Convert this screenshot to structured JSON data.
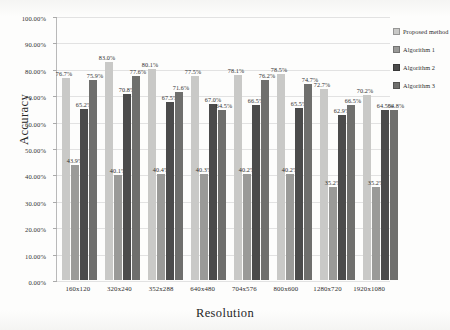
{
  "chart_data": {
    "type": "bar",
    "title": "",
    "xlabel": "Resolution",
    "ylabel": "Accuracy",
    "ylim": [
      0,
      100
    ],
    "ytick_labels": [
      "0.00%",
      "10.00%",
      "20.00%",
      "30.00%",
      "40.00%",
      "50.00%",
      "60.00%",
      "70.00%",
      "80.00%",
      "90.00%",
      "100.00%"
    ],
    "ytick_values": [
      0,
      10,
      20,
      30,
      40,
      50,
      60,
      70,
      80,
      90,
      100
    ],
    "grid": true,
    "legend_position": "right",
    "categories": [
      "160x120",
      "320x240",
      "352x288",
      "640x480",
      "704x576",
      "800x600",
      "1280x720",
      "1920x1080"
    ],
    "series": [
      {
        "name": "Proposed method",
        "color": "#c9c9c7",
        "values": [
          76.7,
          83.0,
          80.1,
          77.5,
          78.1,
          78.5,
          72.7,
          70.2
        ],
        "labels": [
          "76.7%",
          "83.0%",
          "80.1%",
          "77.5%",
          "78.1%",
          "78.5%",
          "72.7%",
          "70.2%"
        ]
      },
      {
        "name": "Algorithm 1",
        "color": "#9a9a98",
        "values": [
          43.9,
          40.1,
          40.4,
          40.3,
          40.2,
          40.2,
          35.2,
          35.2
        ],
        "labels": [
          "43.9%",
          "40.1%",
          "40.4%",
          "40.3%",
          "40.2%",
          "40.2%",
          "35.2%",
          "35.2%"
        ]
      },
      {
        "name": "Algorithm 2",
        "color": "#4b4b4b",
        "values": [
          65.2,
          70.8,
          67.5,
          67.0,
          66.5,
          65.5,
          62.9,
          64.5
        ],
        "labels": [
          "65.2%",
          "70.8%",
          "67.5%",
          "67.0%",
          "66.5%",
          "65.5%",
          "62.9%",
          "64.5%"
        ]
      },
      {
        "name": "Algorithm 3",
        "color": "#6f6f6d",
        "values": [
          75.9,
          77.6,
          71.6,
          64.5,
          76.2,
          74.7,
          66.5,
          64.8
        ],
        "labels": [
          "75.9%",
          "77.6%",
          "71.6%",
          "64.5%",
          "76.2%",
          "74.7%",
          "66.5%",
          "64.8%"
        ]
      }
    ]
  }
}
